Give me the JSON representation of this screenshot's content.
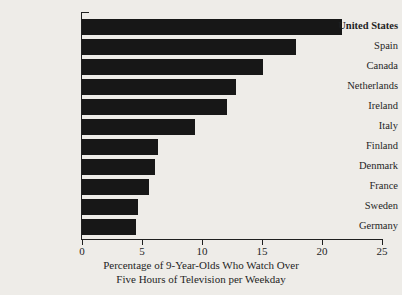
{
  "chart_data": {
    "type": "bar",
    "orientation": "horizontal",
    "title": "",
    "xlabel_line1": "Percentage of 9-Year-Olds Who Watch Over",
    "xlabel_line2": "Five Hours of Television per Weekday",
    "ylabel": "",
    "xlim": [
      0,
      25
    ],
    "xticks": [
      0,
      5,
      10,
      15,
      20,
      25
    ],
    "xtick_labels": [
      "0",
      "5",
      "10",
      "15",
      "20",
      "25"
    ],
    "grid": false,
    "legend": null,
    "bar_color": "#171717",
    "background_color": "#eeece8",
    "highlight_category": "United States",
    "categories": [
      "United States",
      "Spain",
      "Canada",
      "Netherlands",
      "Ireland",
      "Italy",
      "Finland",
      "Denmark",
      "France",
      "Sweden",
      "Germany"
    ],
    "values": [
      21.7,
      17.8,
      15.1,
      12.8,
      12.1,
      9.4,
      6.3,
      6.1,
      5.6,
      4.7,
      4.5
    ],
    "bars": [
      {
        "label": "United States",
        "value": 21.7,
        "bold": true
      },
      {
        "label": "Spain",
        "value": 17.8,
        "bold": false
      },
      {
        "label": "Canada",
        "value": 15.1,
        "bold": false
      },
      {
        "label": "Netherlands",
        "value": 12.8,
        "bold": false
      },
      {
        "label": "Ireland",
        "value": 12.1,
        "bold": false
      },
      {
        "label": "Italy",
        "value": 9.4,
        "bold": false
      },
      {
        "label": "Finland",
        "value": 6.3,
        "bold": false
      },
      {
        "label": "Denmark",
        "value": 6.1,
        "bold": false
      },
      {
        "label": "France",
        "value": 5.6,
        "bold": false
      },
      {
        "label": "Sweden",
        "value": 4.7,
        "bold": false
      },
      {
        "label": "Germany",
        "value": 4.5,
        "bold": false
      }
    ]
  }
}
